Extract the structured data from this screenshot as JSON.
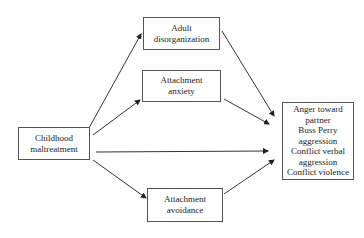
{
  "diagram": {
    "type": "path model",
    "nodes": {
      "predictor": {
        "lines": [
          "Childhood",
          "maltreatment"
        ]
      },
      "adult_disorganization": {
        "lines": [
          "Adult",
          "disorganization"
        ]
      },
      "attachment_anxiety": {
        "lines": [
          "Attachment",
          "anxiety"
        ]
      },
      "attachment_avoidance": {
        "lines": [
          "Attachment",
          "avoidance"
        ]
      },
      "outcomes": {
        "lines": [
          "Anger toward",
          "partner",
          "Buss Perry",
          "aggression",
          "Conflict verbal",
          "aggression",
          "Conflict violence"
        ]
      }
    },
    "edges": [
      {
        "from": "Childhood maltreatment",
        "to": "Adult disorganization"
      },
      {
        "from": "Childhood maltreatment",
        "to": "Attachment anxiety"
      },
      {
        "from": "Childhood maltreatment",
        "to": "Outcomes"
      },
      {
        "from": "Childhood maltreatment",
        "to": "Attachment avoidance"
      },
      {
        "from": "Adult disorganization",
        "to": "Outcomes"
      },
      {
        "from": "Attachment anxiety",
        "to": "Outcomes"
      },
      {
        "from": "Attachment avoidance",
        "to": "Outcomes"
      }
    ]
  }
}
